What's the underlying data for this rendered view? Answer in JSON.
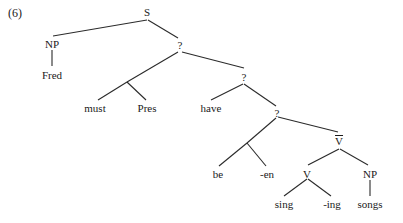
{
  "example_number": "(6)",
  "tree": {
    "nodes": {
      "S": "S",
      "NP1": "NP",
      "Fred": "Fred",
      "Q1": "?",
      "must": "must",
      "Pres": "Pres",
      "Q2": "?",
      "have": "have",
      "Q3": "?",
      "be": "be",
      "en": "-en",
      "Vbar": "V",
      "V": "V",
      "NP2": "NP",
      "sing": "sing",
      "ing": "-ing",
      "songs": "songs"
    },
    "edges": [
      [
        "S",
        "NP1"
      ],
      [
        "S",
        "Q1"
      ],
      [
        "NP1",
        "Fred"
      ],
      [
        "Q1",
        "must+Pres"
      ],
      [
        "must+Pres",
        "must"
      ],
      [
        "must+Pres",
        "Pres"
      ],
      [
        "Q1",
        "Q2"
      ],
      [
        "Q2",
        "have"
      ],
      [
        "Q2",
        "Q3"
      ],
      [
        "Q3",
        "be+en"
      ],
      [
        "be+en",
        "be"
      ],
      [
        "be+en",
        "-en"
      ],
      [
        "Q3",
        "V-bar"
      ],
      [
        "V-bar",
        "V"
      ],
      [
        "V-bar",
        "NP"
      ],
      [
        "V",
        "sing"
      ],
      [
        "V",
        "-ing"
      ],
      [
        "NP",
        "songs"
      ]
    ]
  }
}
